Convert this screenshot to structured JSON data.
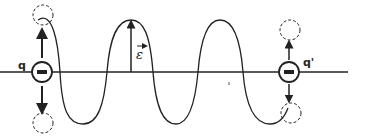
{
  "diagram": {
    "type": "electromagnetic-wave-between-charges",
    "colors": {
      "stroke": "#222222",
      "background": "#ffffff"
    },
    "labels": {
      "left_charge": "q",
      "right_charge": "q'",
      "field": "ε",
      "charge_sign": "−"
    },
    "left_charge": {
      "sign": "negative",
      "oscillation": "up-down",
      "ghost_positions": [
        "top",
        "bottom"
      ]
    },
    "right_charge": {
      "sign": "negative",
      "oscillation": "up-down",
      "ghost_positions": [
        "top",
        "bottom"
      ]
    },
    "wave": {
      "shape": "sinusoid",
      "half_cycles": 6,
      "field_vector": "electric field ε (arrow at crest)"
    }
  }
}
